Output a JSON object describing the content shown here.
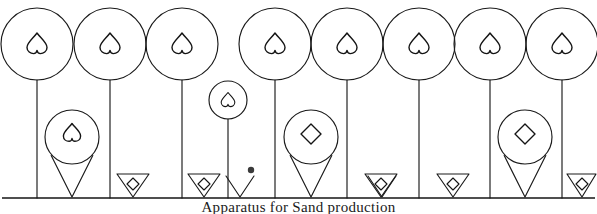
{
  "figure": {
    "caption": "Apparatus for Sand production",
    "background_color": "#ffffff",
    "ink_color": "#1a1a1a",
    "width": 597,
    "height": 214,
    "baseline_y": 198,
    "elements": {
      "large_circles": [
        {
          "name": "head-1",
          "cx": 37,
          "cy": 44,
          "r": 36,
          "glyph": "inverted-heart"
        },
        {
          "name": "head-2",
          "cx": 110,
          "cy": 44,
          "r": 36,
          "glyph": "inverted-heart"
        },
        {
          "name": "head-3",
          "cx": 182,
          "cy": 44,
          "r": 36,
          "glyph": "inverted-heart"
        },
        {
          "name": "head-4",
          "cx": 275,
          "cy": 44,
          "r": 36,
          "glyph": "inverted-heart"
        },
        {
          "name": "head-5",
          "cx": 347,
          "cy": 44,
          "r": 36,
          "glyph": "inverted-heart"
        },
        {
          "name": "head-6",
          "cx": 419,
          "cy": 44,
          "r": 36,
          "glyph": "inverted-heart"
        },
        {
          "name": "head-7",
          "cx": 490,
          "cy": 44,
          "r": 36,
          "glyph": "inverted-heart"
        },
        {
          "name": "head-8",
          "cx": 562,
          "cy": 44,
          "r": 36,
          "glyph": "inverted-heart"
        }
      ],
      "stems": [
        {
          "name": "stem-1",
          "x": 37,
          "y_top": 80,
          "y_bottom": 198
        },
        {
          "name": "stem-2",
          "x": 110,
          "y_top": 80,
          "y_bottom": 198
        },
        {
          "name": "stem-3",
          "x": 182,
          "y_top": 80,
          "y_bottom": 198
        },
        {
          "name": "stem-small",
          "x": 228,
          "y_top": 119,
          "y_bottom": 198
        },
        {
          "name": "stem-4",
          "x": 275,
          "y_top": 80,
          "y_bottom": 198
        },
        {
          "name": "stem-5",
          "x": 347,
          "y_top": 80,
          "y_bottom": 198
        },
        {
          "name": "stem-6",
          "x": 419,
          "y_top": 80,
          "y_bottom": 198
        },
        {
          "name": "stem-7",
          "x": 490,
          "y_top": 80,
          "y_bottom": 198
        },
        {
          "name": "stem-8",
          "x": 562,
          "y_top": 80,
          "y_bottom": 198
        }
      ],
      "funnel_units": [
        {
          "name": "funnel-1",
          "cx": 72,
          "cy": 137,
          "r": 27,
          "glyph": "inverted-heart",
          "tip_x": 72,
          "tip_y": 197
        },
        {
          "name": "funnel-2",
          "cx": 311,
          "cy": 137,
          "r": 27,
          "glyph": "diamond",
          "tip_x": 311,
          "tip_y": 197
        },
        {
          "name": "funnel-3",
          "cx": 525,
          "cy": 137,
          "r": 27,
          "glyph": "diamond",
          "tip_x": 525,
          "tip_y": 197
        }
      ],
      "small_circle": {
        "name": "small-head",
        "cx": 228,
        "cy": 100,
        "r": 19,
        "glyph": "inverted-heart"
      },
      "ground_triangles": [
        {
          "name": "triangle-1",
          "cx": 133,
          "top_y": 174,
          "tip_y": 197,
          "half_width": 16,
          "glyph": "diamond"
        },
        {
          "name": "triangle-2",
          "cx": 204,
          "top_y": 174,
          "tip_y": 197,
          "half_width": 16,
          "glyph": "diamond"
        },
        {
          "name": "triangle-3",
          "cx": 381,
          "top_y": 174,
          "tip_y": 197,
          "half_width": 16,
          "glyph": "diamond"
        },
        {
          "name": "triangle-4",
          "cx": 453,
          "top_y": 174,
          "tip_y": 197,
          "half_width": 16,
          "glyph": "diamond"
        },
        {
          "name": "triangle-5",
          "cx": 583,
          "top_y": 174,
          "tip_y": 197,
          "half_width": 16,
          "glyph": "diamond"
        }
      ],
      "plain_cones": [
        {
          "name": "cone-1",
          "cx": 240,
          "top_y": 176,
          "tip_y": 197,
          "half_width": 14
        },
        {
          "name": "cone-2",
          "cx": 382,
          "top_y": 176,
          "tip_y": 197,
          "half_width": 14
        }
      ],
      "dot": {
        "name": "ground-dot",
        "cx": 251,
        "cy": 170,
        "r": 3
      },
      "baseline": {
        "name": "ground-line",
        "x1": 2,
        "x2": 595,
        "y": 198
      }
    }
  }
}
